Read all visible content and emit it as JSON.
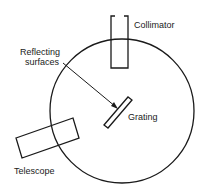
{
  "diagram": {
    "type": "spectrometer schematic",
    "labels": {
      "collimator": "Collimator",
      "reflecting_line1": "Reflecting",
      "reflecting_line2": "surfaces",
      "grating": "Grating",
      "telescope": "Telescope"
    },
    "colors": {
      "stroke": "#1a1a1a",
      "background": "#ffffff"
    }
  }
}
